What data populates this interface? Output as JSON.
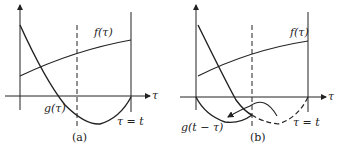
{
  "panels": [
    {
      "id": "a",
      "caption": "(a)",
      "axis_label": "τ",
      "f_label": "f(τ)",
      "g_label": "g(τ)",
      "end_label": "τ = t"
    },
    {
      "id": "b",
      "caption": "(b)",
      "axis_label": "τ",
      "f_label": "f(τ)",
      "g_label": "g(t − τ)",
      "end_label": "τ = t"
    }
  ],
  "colors": {
    "line": "#222222",
    "background": "#ffffff"
  }
}
